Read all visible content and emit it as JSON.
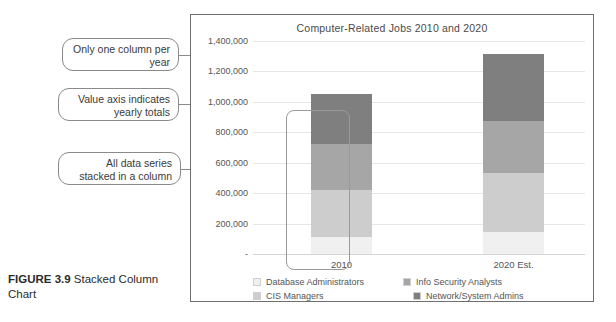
{
  "caption": {
    "figure_label": "FIGURE 3.9",
    "text": " Stacked Column Chart"
  },
  "callouts": [
    {
      "id": "only-one-column",
      "text": "Only one column per year"
    },
    {
      "id": "value-axis",
      "text": "Value axis indicates yearly totals"
    },
    {
      "id": "all-data-series",
      "text": "All data series stacked in a column"
    }
  ],
  "chart_data": {
    "type": "bar",
    "subtype": "stacked-column",
    "title": "Computer-Related Jobs 2010 and 2020",
    "xlabel": "",
    "ylabel": "",
    "categories": [
      "2010",
      "2020 Est."
    ],
    "ytick_labels": [
      "-",
      "200,000",
      "400,000",
      "600,000",
      "800,000",
      "1,000,000",
      "1,200,000",
      "1,400,000"
    ],
    "ytick_values": [
      0,
      200000,
      400000,
      600000,
      800000,
      1000000,
      1200000,
      1400000
    ],
    "ylim": [
      0,
      1400000
    ],
    "grid": true,
    "legend_position": "bottom",
    "series": [
      {
        "name": "Database Administrators",
        "color": "#f0f0f0",
        "values": [
          110000,
          145000
        ]
      },
      {
        "name": "CIS Managers",
        "color": "#cdcdcd",
        "values": [
          310000,
          385000
        ]
      },
      {
        "name": "Info Security Analysts",
        "color": "#a6a6a6",
        "values": [
          300000,
          345000
        ]
      },
      {
        "name": "Network/System Admins",
        "color": "#7f7f7f",
        "values": [
          330000,
          440000
        ]
      }
    ],
    "totals": [
      1050000,
      1315000
    ]
  },
  "legend": {
    "row1": [
      {
        "label": "Database Administrators",
        "color": "#f0f0f0"
      },
      {
        "label": "Info Security Analysts",
        "color": "#a6a6a6"
      }
    ],
    "row2": [
      {
        "label": "CIS Managers",
        "color": "#cdcdcd"
      },
      {
        "label": "Network/System Admins",
        "color": "#7f7f7f"
      }
    ]
  }
}
